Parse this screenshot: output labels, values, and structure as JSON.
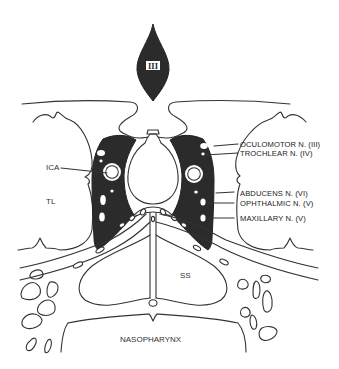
{
  "figure": {
    "type": "anatomical-cross-section",
    "pituitary_stalk_label": "III",
    "colors": {
      "line": "#333333",
      "dark_fill": "#2b2b2b",
      "background": "#ffffff"
    }
  },
  "labels": {
    "left": [
      {
        "id": "ica",
        "text": "ICA"
      },
      {
        "id": "tl",
        "text": "TL"
      }
    ],
    "right": [
      {
        "id": "oculomotor",
        "text": "OCULOMOTOR N. (III)"
      },
      {
        "id": "trochlear",
        "text": "TROCHLEAR N. (IV)"
      },
      {
        "id": "abducens",
        "text": "ABDUCENS N. (VI)"
      },
      {
        "id": "ophthalmic",
        "text": "OPHTHALMIC N. (V)"
      },
      {
        "id": "maxillary",
        "text": "MAXILLARY N. (V)"
      }
    ],
    "center": [
      {
        "id": "ss",
        "text": "SS"
      },
      {
        "id": "nasopharynx",
        "text": "NASOPHARYNX"
      }
    ]
  }
}
